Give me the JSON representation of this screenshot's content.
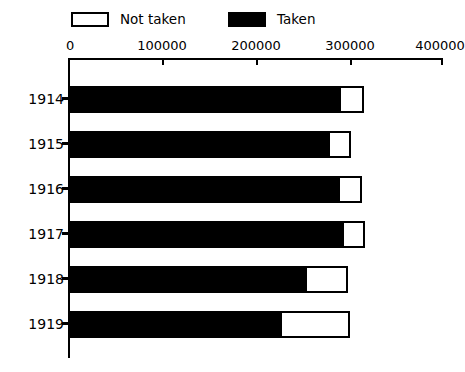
{
  "chart_data": {
    "type": "bar",
    "orientation": "horizontal",
    "stacked": true,
    "title": "",
    "subtitle": "",
    "xlabel": "",
    "ylabel": "",
    "categories": [
      "1914",
      "1915",
      "1916",
      "1917",
      "1918",
      "1919"
    ],
    "series": [
      {
        "name": "Taken",
        "color": "#000000",
        "values": [
          291000,
          279000,
          290000,
          294000,
          255000,
          228000
        ]
      },
      {
        "name": "Not taken",
        "color": "#ffffff",
        "values": [
          25000,
          23000,
          24000,
          23000,
          44000,
          73000
        ]
      }
    ],
    "totals": [
      316000,
      302000,
      314000,
      317000,
      299000,
      301000
    ],
    "xlim": [
      0,
      400000
    ],
    "xticks": [
      0,
      100000,
      200000,
      400000
    ],
    "xtick_labels": [
      "0",
      "100000",
      "200000",
      "300000",
      "400000"
    ],
    "xtick_values": [
      0,
      100000,
      200000,
      300000,
      400000
    ],
    "grid": false,
    "legend_position": "top",
    "annotations": []
  },
  "legend": {
    "entries": [
      {
        "label": "Not taken",
        "swatch": "hollow-square"
      },
      {
        "label": "Taken",
        "swatch": "solid-square"
      }
    ]
  },
  "axis": {
    "tick_labels": [
      "0",
      "100000",
      "200000",
      "300000",
      "400000"
    ]
  },
  "rows": [
    {
      "year": "1914",
      "taken": 291000,
      "not_taken": 25000,
      "total": 316000
    },
    {
      "year": "1915",
      "taken": 279000,
      "not_taken": 23000,
      "total": 302000
    },
    {
      "year": "1916",
      "taken": 290000,
      "not_taken": 24000,
      "total": 314000
    },
    {
      "year": "1917",
      "taken": 294000,
      "not_taken": 23000,
      "total": 317000
    },
    {
      "year": "1918",
      "taken": 255000,
      "not_taken": 44000,
      "total": 299000
    },
    {
      "year": "1919",
      "taken": 228000,
      "not_taken": 73000,
      "total": 301000
    }
  ],
  "colors": {
    "taken": "#000000",
    "not_taken": "#ffffff",
    "axis": "#000000",
    "background": "#ffffff"
  }
}
